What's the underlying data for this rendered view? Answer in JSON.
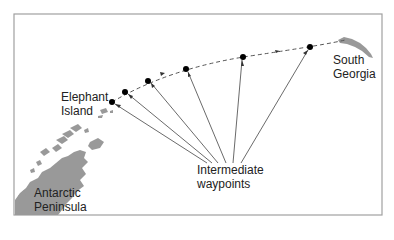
{
  "diagram": {
    "type": "route-map",
    "frame_color": "#a0a0a0",
    "land_color": "#999999",
    "route_color": "#555555",
    "waypoint_color": "#000000",
    "labels": {
      "start": [
        "Elephant",
        "Island"
      ],
      "end": [
        "South",
        "Georgia"
      ],
      "peninsula": [
        "Antarctic",
        "Peninsula"
      ],
      "waypoints_annotation": [
        "Intermediate",
        "waypoints"
      ]
    },
    "waypoints": [
      {
        "x": 112,
        "y": 102
      },
      {
        "x": 125,
        "y": 92
      },
      {
        "x": 148,
        "y": 81
      },
      {
        "x": 186,
        "y": 69
      },
      {
        "x": 243,
        "y": 57
      },
      {
        "x": 310,
        "y": 47
      }
    ],
    "route_end": {
      "x": 345,
      "y": 40
    }
  }
}
